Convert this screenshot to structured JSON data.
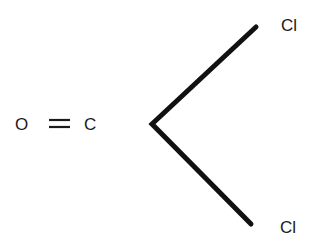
{
  "diagram": {
    "type": "chemical-structure",
    "atoms": {
      "oxygen": "O",
      "bond_double": "=",
      "carbon": "C",
      "chlorine_top": "Cl",
      "chlorine_bottom": "Cl"
    },
    "bonds": [
      {
        "from": "C",
        "to": "O",
        "order": 2
      },
      {
        "from": "C",
        "to": "Cl",
        "order": 1
      },
      {
        "from": "C",
        "to": "Cl",
        "order": 1
      }
    ],
    "colors": {
      "ink": "#1a1a1a",
      "background": "#ffffff"
    }
  }
}
